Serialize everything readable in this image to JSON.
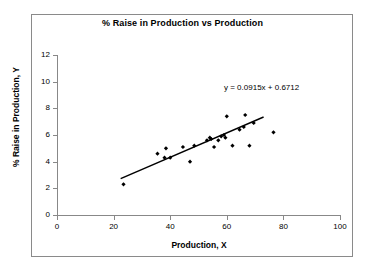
{
  "chart_data": {
    "type": "scatter",
    "title": "% Raise in Production vs Production",
    "xlabel": "Production, X",
    "ylabel": "% Raise in Production, Y",
    "xlim": [
      0,
      100
    ],
    "ylim": [
      0,
      12
    ],
    "xticks": [
      0,
      20,
      40,
      60,
      80,
      100
    ],
    "yticks": [
      0,
      2,
      4,
      6,
      8,
      10,
      12
    ],
    "grid": false,
    "legend": null,
    "annotations": [
      {
        "name": "regression-equation",
        "text": "y = 0.0915x + 0.6712",
        "x": 59,
        "y": 9.6
      }
    ],
    "series": [
      {
        "name": "observations",
        "marker": "diamond",
        "color": "#000000",
        "points": [
          {
            "x": 23.5,
            "y": 2.3
          },
          {
            "x": 35.5,
            "y": 4.6
          },
          {
            "x": 38.0,
            "y": 4.3
          },
          {
            "x": 38.5,
            "y": 5.0
          },
          {
            "x": 40.0,
            "y": 4.3
          },
          {
            "x": 44.5,
            "y": 5.1
          },
          {
            "x": 47.0,
            "y": 4.0
          },
          {
            "x": 48.5,
            "y": 5.2
          },
          {
            "x": 53.0,
            "y": 5.6
          },
          {
            "x": 54.0,
            "y": 5.8
          },
          {
            "x": 54.5,
            "y": 5.7
          },
          {
            "x": 55.5,
            "y": 5.1
          },
          {
            "x": 57.0,
            "y": 5.6
          },
          {
            "x": 58.0,
            "y": 5.9
          },
          {
            "x": 59.0,
            "y": 6.0
          },
          {
            "x": 59.5,
            "y": 5.8
          },
          {
            "x": 60.0,
            "y": 7.4
          },
          {
            "x": 62.0,
            "y": 5.2
          },
          {
            "x": 64.5,
            "y": 6.4
          },
          {
            "x": 66.0,
            "y": 6.6
          },
          {
            "x": 66.5,
            "y": 7.5
          },
          {
            "x": 68.0,
            "y": 5.2
          },
          {
            "x": 69.5,
            "y": 6.9
          },
          {
            "x": 76.5,
            "y": 6.2
          }
        ]
      }
    ],
    "trendline": {
      "name": "linear-fit",
      "equation": "y = 0.0915x + 0.6712",
      "slope": 0.0915,
      "intercept": 0.6712,
      "x_start": 22.5,
      "x_end": 73.0,
      "color": "#000000"
    }
  }
}
